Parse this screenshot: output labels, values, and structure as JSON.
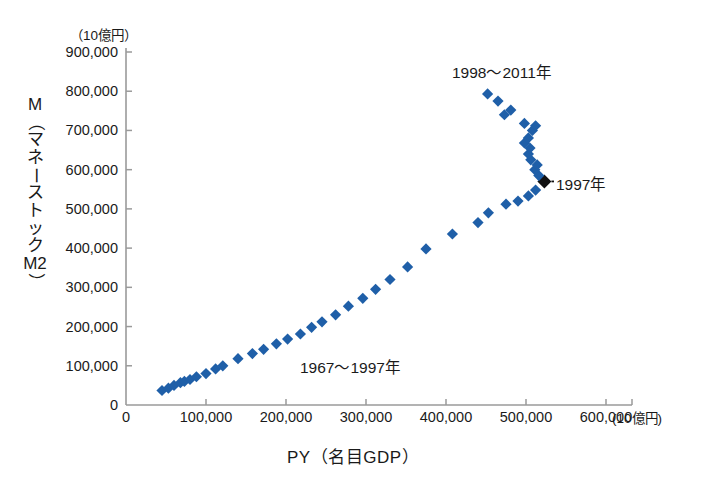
{
  "chart_data": {
    "type": "scatter",
    "title": "",
    "xlabel": "PY（名目GDP）",
    "ylabel": "M（マネーストックM2）",
    "x_unit_label": "(10億円)",
    "y_unit_label": "（10億円）",
    "xlim": [
      0,
      620000
    ],
    "ylim": [
      0,
      900000
    ],
    "xticks": [
      "0",
      "100,000",
      "200,000",
      "300,000",
      "400,000",
      "500,000",
      "600,000"
    ],
    "xtick_values": [
      0,
      100000,
      200000,
      300000,
      400000,
      500000,
      600000
    ],
    "yticks": [
      "0",
      "100,000",
      "200,000",
      "300,000",
      "400,000",
      "500,000",
      "600,000",
      "700,000",
      "800,000",
      "900,000"
    ],
    "ytick_values": [
      0,
      100000,
      200000,
      300000,
      400000,
      500000,
      600000,
      700000,
      800000,
      900000
    ],
    "grid": false,
    "legend": false,
    "marker": "diamond",
    "series": [
      {
        "name": "1967〜1997年",
        "color": "#1f5fa8",
        "points": [
          {
            "year": 1967,
            "x": 45000,
            "y": 37000
          },
          {
            "year": 1968,
            "x": 53000,
            "y": 43000
          },
          {
            "year": 1969,
            "x": 60000,
            "y": 50000
          },
          {
            "year": 1970,
            "x": 68000,
            "y": 57000
          },
          {
            "year": 1971,
            "x": 73000,
            "y": 60000
          },
          {
            "year": 1972,
            "x": 80000,
            "y": 65000
          },
          {
            "year": 1973,
            "x": 88000,
            "y": 72000
          },
          {
            "year": 1974,
            "x": 100000,
            "y": 80000
          },
          {
            "year": 1975,
            "x": 112000,
            "y": 92000
          },
          {
            "year": 1976,
            "x": 121000,
            "y": 100000
          },
          {
            "year": 1977,
            "x": 140000,
            "y": 118000
          },
          {
            "year": 1978,
            "x": 158000,
            "y": 131000
          },
          {
            "year": 1979,
            "x": 172000,
            "y": 142000
          },
          {
            "year": 1980,
            "x": 188000,
            "y": 156000
          },
          {
            "year": 1981,
            "x": 202000,
            "y": 168000
          },
          {
            "year": 1982,
            "x": 218000,
            "y": 181000
          },
          {
            "year": 1983,
            "x": 232000,
            "y": 198000
          },
          {
            "year": 1984,
            "x": 245000,
            "y": 212000
          },
          {
            "year": 1985,
            "x": 262000,
            "y": 230000
          },
          {
            "year": 1986,
            "x": 278000,
            "y": 252000
          },
          {
            "year": 1987,
            "x": 296000,
            "y": 272000
          },
          {
            "year": 1988,
            "x": 312000,
            "y": 295000
          },
          {
            "year": 1989,
            "x": 330000,
            "y": 320000
          },
          {
            "year": 1990,
            "x": 352000,
            "y": 352000
          },
          {
            "year": 1991,
            "x": 375000,
            "y": 398000
          },
          {
            "year": 1992,
            "x": 408000,
            "y": 436000
          },
          {
            "year": 1993,
            "x": 440000,
            "y": 465000
          },
          {
            "year": 1994,
            "x": 453000,
            "y": 490000
          },
          {
            "year": 1995,
            "x": 475000,
            "y": 512000
          },
          {
            "year": 1996,
            "x": 490000,
            "y": 520000
          },
          {
            "year": 1997,
            "x": 503000,
            "y": 533000
          },
          {
            "year": 1997.5,
            "x": 512000,
            "y": 548000
          }
        ]
      },
      {
        "name": "1997年",
        "color": "#111111",
        "highlight": true,
        "points": [
          {
            "year": 1997,
            "x": 523000,
            "y": 570000
          }
        ]
      },
      {
        "name": "1998〜2011年",
        "color": "#1f5fa8",
        "points": [
          {
            "year": 1998,
            "x": 516000,
            "y": 585000
          },
          {
            "year": 1999,
            "x": 511000,
            "y": 600000
          },
          {
            "year": 2000,
            "x": 514000,
            "y": 612000
          },
          {
            "year": 2001,
            "x": 506000,
            "y": 625000
          },
          {
            "year": 2002,
            "x": 503000,
            "y": 640000
          },
          {
            "year": 2003,
            "x": 505000,
            "y": 655000
          },
          {
            "year": 2004,
            "x": 498000,
            "y": 668000
          },
          {
            "year": 2005,
            "x": 503000,
            "y": 681000
          },
          {
            "year": 2006,
            "x": 508000,
            "y": 700000
          },
          {
            "year": 2007,
            "x": 512000,
            "y": 712000
          },
          {
            "year": 2008,
            "x": 498000,
            "y": 718000
          },
          {
            "year": 2009,
            "x": 473000,
            "y": 740000
          },
          {
            "year": 2010,
            "x": 481000,
            "y": 752000
          },
          {
            "year": 2011,
            "x": 465000,
            "y": 775000
          },
          {
            "year": 2011.5,
            "x": 452000,
            "y": 793000
          }
        ]
      }
    ],
    "annotations": [
      {
        "id": "late-period",
        "text": "1998〜2011年"
      },
      {
        "id": "early-period",
        "text": "1967〜1997年"
      },
      {
        "id": "year-1997",
        "text": "1997年"
      }
    ]
  }
}
